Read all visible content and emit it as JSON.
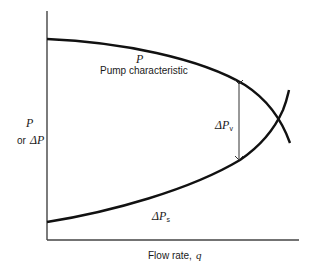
{
  "diagram": {
    "title": "",
    "y_axis_label": {
      "symbol": "P",
      "connector": "or",
      "alt_symbol": "ΔP"
    },
    "x_axis_label": "Flow rate, q",
    "x_axis_text": "Flow rate,",
    "x_axis_var": "q",
    "curves": [
      {
        "id": "pump",
        "symbol": "P",
        "label": "Pump characteristic",
        "shape": "decreasing concave-down"
      },
      {
        "id": "system",
        "symbol": "ΔP",
        "subscript": "s",
        "shape": "increasing concave-up"
      }
    ],
    "annotation": {
      "symbol": "ΔP",
      "subscript": "v",
      "meaning": "double-headed arrow between pump curve and system curve"
    },
    "colors": {
      "line": "#111111",
      "axis": "#444444",
      "text": "#1a1a1a",
      "background": "#ffffff"
    }
  }
}
